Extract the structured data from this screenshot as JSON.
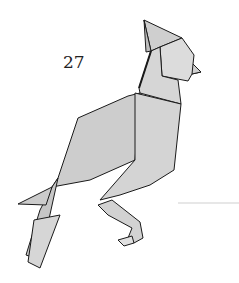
{
  "diagram": {
    "step_number": "27",
    "colors": {
      "paper": "#d8d8d8",
      "paper_dark": "#c4c4c4",
      "line": "#1a1a1a"
    }
  }
}
